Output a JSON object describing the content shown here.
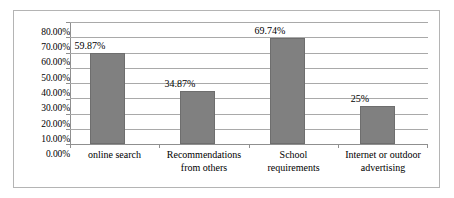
{
  "chart_data": {
    "type": "bar",
    "title": "",
    "subtitle": "",
    "xlabel": "",
    "ylabel": "",
    "ylim": [
      0,
      80
    ],
    "grid": true,
    "legend": false,
    "orientation": "vertical",
    "categories": [
      "online search",
      "Recommendations from others",
      "School requirements",
      "Internet or outdoor advertising"
    ],
    "category_lines": [
      [
        "online search",
        ""
      ],
      [
        "Recommendations",
        "from others"
      ],
      [
        "School",
        "requirements"
      ],
      [
        "Internet or outdoor",
        "advertising"
      ]
    ],
    "values": [
      59.87,
      34.87,
      69.74,
      25
    ],
    "data_labels": [
      "59.87%",
      "34.87%",
      "69.74%",
      "25%"
    ],
    "ytick_labels": [
      "80.00%",
      "70.00%",
      "60.00%",
      "50.00%",
      "40.00%",
      "30.00%",
      "20.00%",
      "10.00%",
      "0.00%"
    ],
    "ytick_values": [
      80,
      70,
      60,
      50,
      40,
      30,
      20,
      10,
      0
    ],
    "colors": {
      "bar_fill": "#808080",
      "bar_border": "#6e6e6e",
      "gridline": "#a9a9a9",
      "axis": "#8f8f8f",
      "frame": "#b4b4b4",
      "text": "#000000",
      "background": "#ffffff"
    }
  }
}
